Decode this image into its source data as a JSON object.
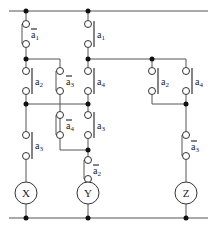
{
  "diagram": {
    "type": "relay ladder diagram",
    "rails": {
      "top": "supply-rail",
      "bottom": "return-rail"
    },
    "coils": [
      {
        "id": "X",
        "label": "X"
      },
      {
        "id": "Y",
        "label": "Y"
      },
      {
        "id": "Z",
        "label": "Z"
      }
    ],
    "contacts": [
      {
        "id": "c1",
        "var": "a",
        "sub": "1",
        "negated": true,
        "branch": "X"
      },
      {
        "id": "c2",
        "var": "a",
        "sub": "1",
        "negated": false,
        "branch": "Y"
      },
      {
        "id": "c3",
        "var": "a",
        "sub": "2",
        "negated": false,
        "branch": "X"
      },
      {
        "id": "c4",
        "var": "a",
        "sub": "3",
        "negated": true,
        "branch": "X-Y bridge"
      },
      {
        "id": "c5",
        "var": "a",
        "sub": "4",
        "negated": false,
        "branch": "Y"
      },
      {
        "id": "c6",
        "var": "a",
        "sub": "4",
        "negated": true,
        "branch": "X-Y bridge"
      },
      {
        "id": "c7",
        "var": "a",
        "sub": "3",
        "negated": false,
        "branch": "Y"
      },
      {
        "id": "c8",
        "var": "a",
        "sub": "3",
        "negated": false,
        "branch": "X"
      },
      {
        "id": "c9",
        "var": "a",
        "sub": "2",
        "negated": true,
        "branch": "Y"
      },
      {
        "id": "c10",
        "var": "a",
        "sub": "2",
        "negated": false,
        "branch": "Z"
      },
      {
        "id": "c11",
        "var": "a",
        "sub": "4",
        "negated": false,
        "branch": "Z"
      },
      {
        "id": "c12",
        "var": "a",
        "sub": "3",
        "negated": true,
        "branch": "Z"
      }
    ]
  }
}
